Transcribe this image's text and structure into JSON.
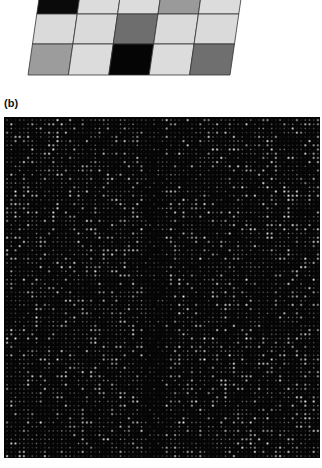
{
  "panel_a": {
    "description": "Perspective view of a 3x5 grid of gray-level squares (microarray spot illustration)",
    "rows": 3,
    "cols": 5,
    "geometry": {
      "top_left": [
        41,
        -15
      ],
      "top_right": [
        243,
        -15
      ],
      "bottom_left": [
        28,
        75
      ],
      "bottom_right": [
        230,
        75
      ],
      "row_bounds": [
        -15,
        14,
        44,
        75
      ]
    },
    "cells": [
      [
        "#0a0a0a",
        "#dcdcdc",
        "#dcdcdc",
        "#9a9a9a",
        "#dcdcdc"
      ],
      [
        "#dadada",
        "#dadada",
        "#6e6e6e",
        "#dadada",
        "#dadada"
      ],
      [
        "#9c9c9c",
        "#dcdcdc",
        "#050505",
        "#dcdcdc",
        "#6f6f6f"
      ]
    ],
    "grid_line_color": "#333333"
  },
  "panel_b": {
    "label": "(b)",
    "description": "Microarray scan image: dark background with grid of bright spots",
    "background": "#050505",
    "spot_pitch_px": 4.2,
    "seed": 1337
  }
}
